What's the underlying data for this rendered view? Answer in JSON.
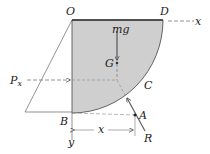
{
  "diagram": {
    "type": "free-body diagram",
    "colors": {
      "body_fill": "#cfcfcf",
      "body_stroke": "#444444",
      "line": "#555555",
      "text": "#222222"
    },
    "labels": {
      "O": "O",
      "D": "D",
      "x_axis": "x",
      "mg": "mg",
      "G": "G",
      "Px": "P",
      "Px_sub": "x",
      "C": "C",
      "A": "A",
      "B": "B",
      "R": "R",
      "x_dim": "x",
      "y_axis": "y"
    },
    "elements": [
      {
        "name": "quarter-disk-body",
        "shape": "quarter circle sector",
        "corner": "O",
        "ends": [
          "D",
          "B"
        ]
      },
      {
        "name": "weight-force",
        "label": "mg",
        "direction": "down",
        "acts_at": "G"
      },
      {
        "name": "horizontal-force",
        "label": "Px",
        "direction": "right"
      },
      {
        "name": "reaction-force",
        "label": "R",
        "acts_at": "A",
        "through": "C"
      },
      {
        "name": "dimension",
        "label": "x",
        "from": "B",
        "to": "A"
      }
    ]
  }
}
